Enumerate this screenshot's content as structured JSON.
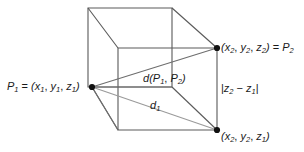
{
  "figure": {
    "name": "distance-between-two-points-in-space",
    "colors": {
      "box_edge": "#5a5a5a",
      "diagonal": "#8c8c8c",
      "vertex_dot": "#111111",
      "text": "#1a1a1a",
      "background": "#ffffff"
    },
    "labels": {
      "p1": {
        "text": "P1 = (x1, y1, z1)",
        "parts": [
          "P",
          "1",
          " = (",
          "x",
          "1",
          ", ",
          "y",
          "1",
          ", ",
          "z",
          "1",
          ")"
        ]
      },
      "p2": {
        "text": "(x2, y2, z2) = P2"
      },
      "p2_base": {
        "text": "(x2, y2, z1)"
      },
      "distance": {
        "text": "d(P1, P2)"
      },
      "d1": {
        "text": "d1"
      },
      "delta_z": {
        "text": "|z2 - z1|"
      }
    },
    "vertices": [
      {
        "name": "p1",
        "x": 92,
        "y": 87
      },
      {
        "name": "p2",
        "x": 217,
        "y": 48
      },
      {
        "name": "p2-base",
        "x": 217,
        "y": 130
      }
    ]
  }
}
